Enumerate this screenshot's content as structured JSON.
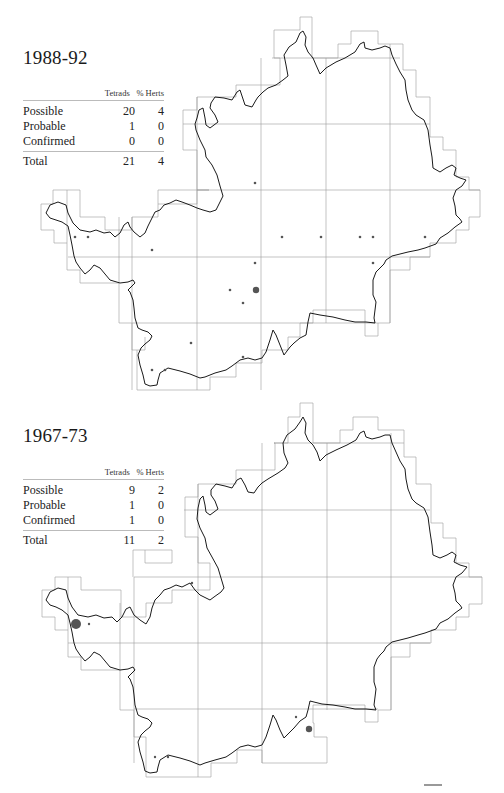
{
  "panels": [
    {
      "period": "1988-92",
      "table": {
        "headers": [
          "",
          "Tetrads",
          "% Herts"
        ],
        "rows": [
          {
            "label": "Possible",
            "tetrads": "20",
            "pct": "4"
          },
          {
            "label": "Probable",
            "tetrads": "1",
            "pct": "0"
          },
          {
            "label": "Confirmed",
            "tetrads": "0",
            "pct": "0"
          }
        ],
        "total": {
          "label": "Total",
          "tetrads": "21",
          "pct": "4"
        }
      },
      "records": {
        "small_dots": [
          [
            255,
            183
          ],
          [
            75,
            237
          ],
          [
            88,
            237
          ],
          [
            152,
            250
          ],
          [
            282,
            237
          ],
          [
            321,
            237
          ],
          [
            360,
            237
          ],
          [
            373,
            237
          ],
          [
            425,
            237
          ],
          [
            255,
            263
          ],
          [
            373,
            263
          ],
          [
            230,
            290
          ],
          [
            243,
            303
          ],
          [
            191,
            343
          ],
          [
            152,
            370
          ],
          [
            165,
            370
          ],
          [
            243,
            357
          ]
        ],
        "large_dots": [
          [
            256,
            290
          ]
        ]
      }
    },
    {
      "period": "1967-73",
      "table": {
        "headers": [
          "",
          "Tetrads",
          "% Herts"
        ],
        "rows": [
          {
            "label": "Possible",
            "tetrads": "9",
            "pct": "2"
          },
          {
            "label": "Probable",
            "tetrads": "1",
            "pct": "0"
          },
          {
            "label": "Confirmed",
            "tetrads": "1",
            "pct": "0"
          }
        ],
        "total": {
          "label": "Total",
          "tetrads": "11",
          "pct": "2"
        }
      },
      "records": {
        "small_dots": [
          [
            192,
            188
          ],
          [
            89,
            229
          ],
          [
            296,
            322
          ],
          [
            155,
            362
          ],
          [
            168,
            362
          ]
        ],
        "large_dots": [
          [
            76,
            229
          ]
        ],
        "medium_dots": [
          [
            309,
            334
          ]
        ]
      }
    }
  ],
  "colors": {
    "outline": "#1a1a1a",
    "grid": "#8a8a8a",
    "dot": "#555555"
  }
}
